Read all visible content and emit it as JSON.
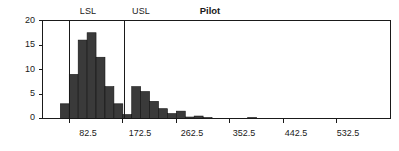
{
  "chart_data": {
    "type": "bar",
    "title": "Pilot",
    "xlabel": "",
    "ylabel": "",
    "grid": false,
    "legend": false,
    "xlim": [
      37.5,
      622.5
    ],
    "ylim": [
      0,
      20
    ],
    "bin_width": 15,
    "x_ticks": [
      "82.5",
      "172.5",
      "262.5",
      "352.5",
      "442.5",
      "532.5"
    ],
    "x_tick_values": [
      82.5,
      172.5,
      262.5,
      352.5,
      442.5,
      532.5
    ],
    "y_ticks": [
      "0",
      "5",
      "10",
      "15",
      "20"
    ],
    "y_tick_values": [
      0,
      5,
      10,
      15,
      20
    ],
    "bar_color": "#3a3a3a",
    "line_color": "#1a1a1a",
    "categories": [
      45,
      60,
      75,
      90,
      105,
      120,
      135,
      150,
      165,
      180,
      195,
      210,
      225,
      240,
      255,
      270,
      285,
      300,
      315,
      330,
      345,
      360,
      375,
      390,
      405,
      420,
      435,
      450,
      465,
      480,
      495,
      510,
      525,
      540,
      555,
      570,
      585,
      600,
      615
    ],
    "values": [
      0,
      0,
      3,
      9,
      16,
      17.5,
      12.5,
      6.5,
      3,
      0.8,
      6.5,
      5.5,
      3.5,
      2,
      1,
      1.5,
      0.3,
      0.5,
      0.2,
      0,
      0,
      0,
      0,
      0.2,
      0,
      0,
      0,
      0,
      0,
      0,
      0,
      0,
      0,
      0,
      0,
      0,
      0,
      0,
      0
    ],
    "annotations": [
      {
        "name": "LSL",
        "label": "LSL",
        "x": 82.5
      },
      {
        "name": "USL",
        "label": "USL",
        "x": 175.0
      }
    ]
  }
}
